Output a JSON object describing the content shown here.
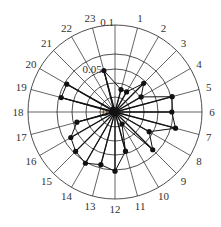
{
  "chart_data": {
    "type": "radar",
    "title": "",
    "angular_axis": {
      "labels": [
        "1",
        "2",
        "3",
        "4",
        "5",
        "6",
        "7",
        "8",
        "9",
        "10",
        "11",
        "12",
        "13",
        "14",
        "15",
        "16",
        "17",
        "18",
        "19",
        "20",
        "21",
        "22",
        "23"
      ],
      "start": "top",
      "direction": "clockwise",
      "spokes": 24
    },
    "radial_axis": {
      "tick_labels": [
        "0",
        "0.05",
        "0.1"
      ],
      "range": [
        0,
        0.1
      ],
      "rings": 6
    },
    "series": [
      {
        "name": "series-1",
        "categories": [
          "1",
          "2",
          "3",
          "4",
          "5",
          "6",
          "7",
          "8",
          "9",
          "10",
          "11",
          "12",
          "13",
          "14",
          "15",
          "16",
          "17",
          "18",
          "19",
          "20",
          "21",
          "22",
          "23"
        ],
        "values": [
          0.02,
          0.02,
          0.035,
          0.026,
          0.052,
          0.049,
          0.058,
          0.034,
          0.046,
          0.012,
          0.035,
          0.052,
          0.047,
          0.052,
          0.048,
          0.044,
          0.034,
          0.003,
          0.048,
          0.048,
          0.003,
          0.003,
          0.037
        ]
      }
    ]
  },
  "labels": {
    "center": "0",
    "ring_005": "0.05",
    "ring_01": "0.1"
  },
  "caption": ""
}
